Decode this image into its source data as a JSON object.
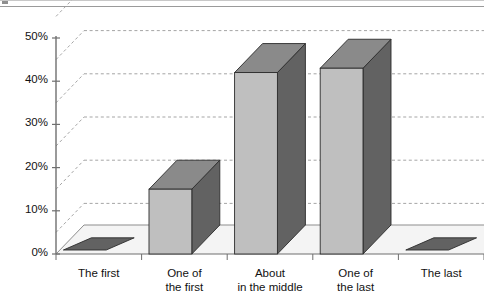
{
  "chart_data": {
    "type": "bar",
    "title": "",
    "subtitle": "",
    "xlabel": "",
    "ylabel": "",
    "categories": [
      "The first",
      "One of the first",
      "About in the middle",
      "One of the last",
      "The last"
    ],
    "category_lines": [
      [
        "The first"
      ],
      [
        "One of",
        "the first"
      ],
      [
        "About",
        "in the middle"
      ],
      [
        "One of",
        "the last"
      ],
      [
        "The last"
      ]
    ],
    "values": [
      0,
      15,
      42,
      43,
      0
    ],
    "value_labels": [
      "0%",
      "15%",
      "42%",
      "43%",
      "0%"
    ],
    "ylim": [
      0,
      55
    ],
    "yticks": [
      0,
      10,
      20,
      30,
      40,
      50
    ],
    "ytick_labels": [
      "0%",
      "10%",
      "20%",
      "30%",
      "40%",
      "50%"
    ],
    "grid": true,
    "gridlines_percent": [
      5,
      15,
      25,
      35,
      45,
      55
    ],
    "legend": "none",
    "legend_position": "none",
    "three_d": true,
    "series": [
      {
        "name": "Share of respondents",
        "values": [
          0,
          15,
          42,
          43,
          0
        ]
      }
    ],
    "annotations": [],
    "colors": {
      "bar_front": "#bfbfbf",
      "bar_side": "#626262",
      "bar_top": "#8a8a8a",
      "bar_outline": "#2b2b2b",
      "gridline": "#9b9b9b",
      "axis": "#6f6f6f",
      "floor": "#f2f2f2",
      "background": "#ffffff",
      "text": "#111111",
      "frame_rule": "#9a9a9a"
    }
  },
  "icons": {
    "corner_mark": "corner-mark-icon"
  }
}
